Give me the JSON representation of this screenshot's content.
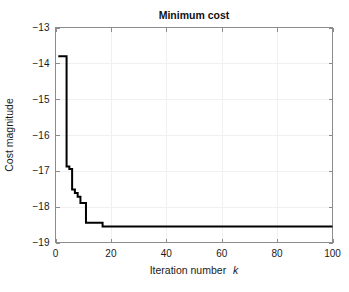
{
  "figure": {
    "background_color": "#ffffff",
    "axes_color": "#8c8c8c",
    "grid_color": "#f0f0f0",
    "line_color": "#000000"
  },
  "chart_data": {
    "type": "line",
    "title": "Minimum cost",
    "xlabel_main": "Iteration number",
    "xlabel_italic": "k",
    "ylabel": "Cost magnitude",
    "xlim": [
      0,
      100
    ],
    "ylim": [
      -19,
      -13
    ],
    "xticks": [
      0,
      20,
      40,
      60,
      80,
      100
    ],
    "yticks": [
      -19,
      -18,
      -17,
      -16,
      -15,
      -14,
      -13
    ],
    "xtick_labels": [
      "0",
      "20",
      "40",
      "60",
      "80",
      "100"
    ],
    "ytick_labels": [
      "−19",
      "−18",
      "−17",
      "−16",
      "−15",
      "−14",
      "−13"
    ],
    "grid": true,
    "legend": null,
    "series": [
      {
        "name": "minimum cost",
        "x": [
          1,
          2,
          3,
          4,
          5,
          6,
          7,
          8,
          9,
          10,
          11,
          12,
          13,
          14,
          15,
          16,
          17,
          18,
          19,
          20,
          25,
          30,
          35,
          40,
          45,
          50,
          55,
          60,
          65,
          70,
          75,
          80,
          85,
          90,
          95,
          100
        ],
        "values": [
          -13.8,
          -13.8,
          -13.8,
          -16.88,
          -16.95,
          -17.52,
          -17.62,
          -17.72,
          -17.9,
          -17.9,
          -18.45,
          -18.45,
          -18.45,
          -18.45,
          -18.45,
          -18.45,
          -18.55,
          -18.55,
          -18.55,
          -18.55,
          -18.55,
          -18.55,
          -18.55,
          -18.55,
          -18.55,
          -18.55,
          -18.55,
          -18.55,
          -18.55,
          -18.55,
          -18.55,
          -18.55,
          -18.55,
          -18.55,
          -18.55,
          -18.55
        ]
      }
    ]
  }
}
